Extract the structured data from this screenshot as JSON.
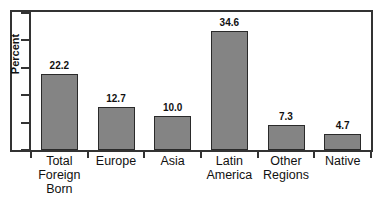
{
  "chart_data": {
    "type": "bar",
    "title": "",
    "subtitle": "",
    "xlabel": "",
    "ylabel": "Percent",
    "ylim": [
      0,
      40
    ],
    "grid": false,
    "legend": null,
    "y_ticks_labeled": false,
    "y_tick_count": 6,
    "categories": [
      "Total\nForeign\nBorn",
      "Europe",
      "Asia",
      "Latin\nAmerica",
      "Other\nRegions",
      "Native"
    ],
    "values": [
      22.2,
      12.7,
      10.0,
      34.6,
      7.3,
      4.7
    ],
    "value_labels": [
      "22.2",
      "12.7",
      "10.0",
      "34.6",
      "7.3",
      "4.7"
    ],
    "bar_color": "#848484",
    "bar_edge_color": "#2a2a2a",
    "axis_color": "#333333",
    "background_color": "#ffffff"
  }
}
